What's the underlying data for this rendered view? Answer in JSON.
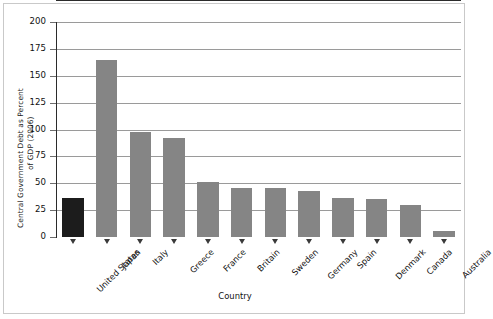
{
  "chart_data": {
    "type": "bar",
    "title": "",
    "xlabel": "Country",
    "ylabel": "Central Government Debt as Percent of GDP (2006)",
    "ylabel_lines": [
      "Central Government Debt as Percent",
      "of GDP (2006)"
    ],
    "categories": [
      "United States",
      "Japan",
      "Italy",
      "Greece",
      "France",
      "Britain",
      "Sweden",
      "Germany",
      "Spain",
      "Denmark",
      "Canada",
      "Australia"
    ],
    "values": [
      36,
      165,
      98,
      92,
      51,
      46,
      46,
      43,
      36,
      35,
      30,
      6
    ],
    "ylim": [
      0,
      200
    ],
    "yticks": [
      0,
      25,
      50,
      75,
      100,
      125,
      150,
      175,
      200
    ],
    "ytick_labels": [
      "0",
      "25",
      "50",
      "75",
      "100",
      "125",
      "150",
      "175",
      "200"
    ],
    "grid": true,
    "legend": "none",
    "highlight_index": 0,
    "colors": {
      "bar": "#858585",
      "bar_highlight": "#1c1c1c",
      "gridline": "#9a9a9a",
      "axis": "#2b2b2b",
      "frame_border": "#c9c9c9",
      "background": "#ffffff",
      "text": "#111111"
    }
  }
}
